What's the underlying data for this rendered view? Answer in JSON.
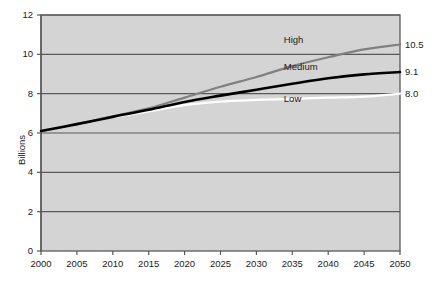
{
  "chart_data": {
    "type": "line",
    "title": "",
    "xlabel": "",
    "ylabel": "Billions",
    "xlim": [
      2000,
      2050
    ],
    "ylim": [
      0,
      12
    ],
    "grid": true,
    "legend_position": "inline-right",
    "x": [
      2000,
      2005,
      2010,
      2015,
      2020,
      2025,
      2030,
      2035,
      2040,
      2045,
      2050
    ],
    "categories": [
      "2000",
      "2005",
      "2010",
      "2015",
      "2020",
      "2025",
      "2030",
      "2035",
      "2040",
      "2045",
      "2050"
    ],
    "yticks": [
      0,
      2,
      4,
      6,
      8,
      10,
      12
    ],
    "ytick_labels": [
      "0",
      "2",
      "4",
      "6",
      "8",
      "10",
      "12"
    ],
    "series": [
      {
        "name": "High",
        "color": "#808080",
        "end_value": 10.5,
        "end_label": "10.5",
        "values": [
          6.1,
          6.45,
          6.85,
          7.25,
          7.8,
          8.35,
          8.85,
          9.4,
          9.85,
          10.25,
          10.5
        ]
      },
      {
        "name": "Medium",
        "color": "#000000",
        "end_value": 9.1,
        "end_label": "9.1",
        "values": [
          6.1,
          6.45,
          6.82,
          7.18,
          7.58,
          7.9,
          8.2,
          8.5,
          8.78,
          8.98,
          9.1
        ]
      },
      {
        "name": "Low",
        "color": "#ffffff",
        "end_value": 8.0,
        "end_label": "8.0",
        "values": [
          6.1,
          6.45,
          6.8,
          7.1,
          7.42,
          7.6,
          7.68,
          7.74,
          7.8,
          7.85,
          8.0
        ]
      }
    ],
    "annotations": [
      {
        "text": "High",
        "x": 2038,
        "y": 10.75
      },
      {
        "text": "Medium",
        "x": 2038,
        "y": 9.35
      },
      {
        "text": "Low",
        "x": 2038,
        "y": 7.75
      }
    ]
  },
  "style": {
    "plot_background": "#d4d4d4",
    "gridline_color": "#595959",
    "axis_color": "#595959",
    "text_color": "#1a1a1a"
  }
}
